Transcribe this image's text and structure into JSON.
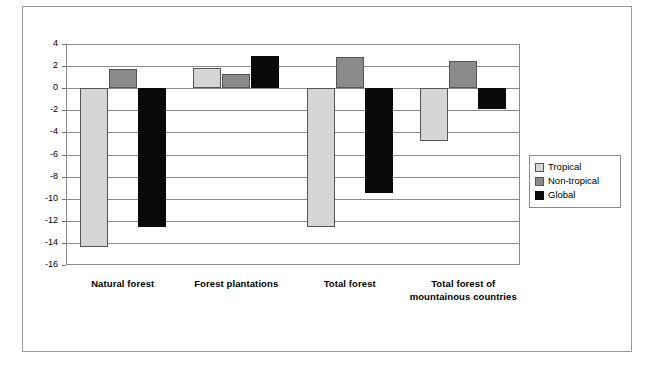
{
  "chart_data": {
    "type": "bar",
    "title": "",
    "subtitle": "",
    "xlabel": "",
    "ylabel": "mlo. ha yr",
    "ylabel_exponent": "-1",
    "ylim": [
      -16,
      4
    ],
    "ytick_step": 2,
    "yticks": [
      4,
      2,
      0,
      -2,
      -4,
      -6,
      -8,
      -10,
      -12,
      -14,
      -16
    ],
    "ytick_labels": [
      "4",
      "2",
      "0",
      "-2",
      "-4",
      "-6",
      "-8",
      "-10",
      "-12",
      "-14",
      "-16"
    ],
    "grid": true,
    "legend_position": "right",
    "categories": [
      "Natural forest",
      "Forest plantations",
      "Total forest",
      "Total forest of mountainous countries"
    ],
    "series": [
      {
        "name": "Tropical",
        "color": "#d5d5d5",
        "values": [
          -14.4,
          1.8,
          -12.6,
          -4.8
        ]
      },
      {
        "name": "Non-tropical",
        "color": "#8a8a8a",
        "values": [
          1.7,
          1.3,
          2.8,
          2.5
        ]
      },
      {
        "name": "Global",
        "color": "#0a0a0a",
        "values": [
          -12.6,
          2.9,
          -9.5,
          -1.9
        ]
      }
    ]
  },
  "legend": {
    "items": [
      {
        "label": "Tropical",
        "key": "tropical"
      },
      {
        "label": "Non-tropical",
        "key": "nontropical"
      },
      {
        "label": "Global",
        "key": "global"
      }
    ]
  }
}
